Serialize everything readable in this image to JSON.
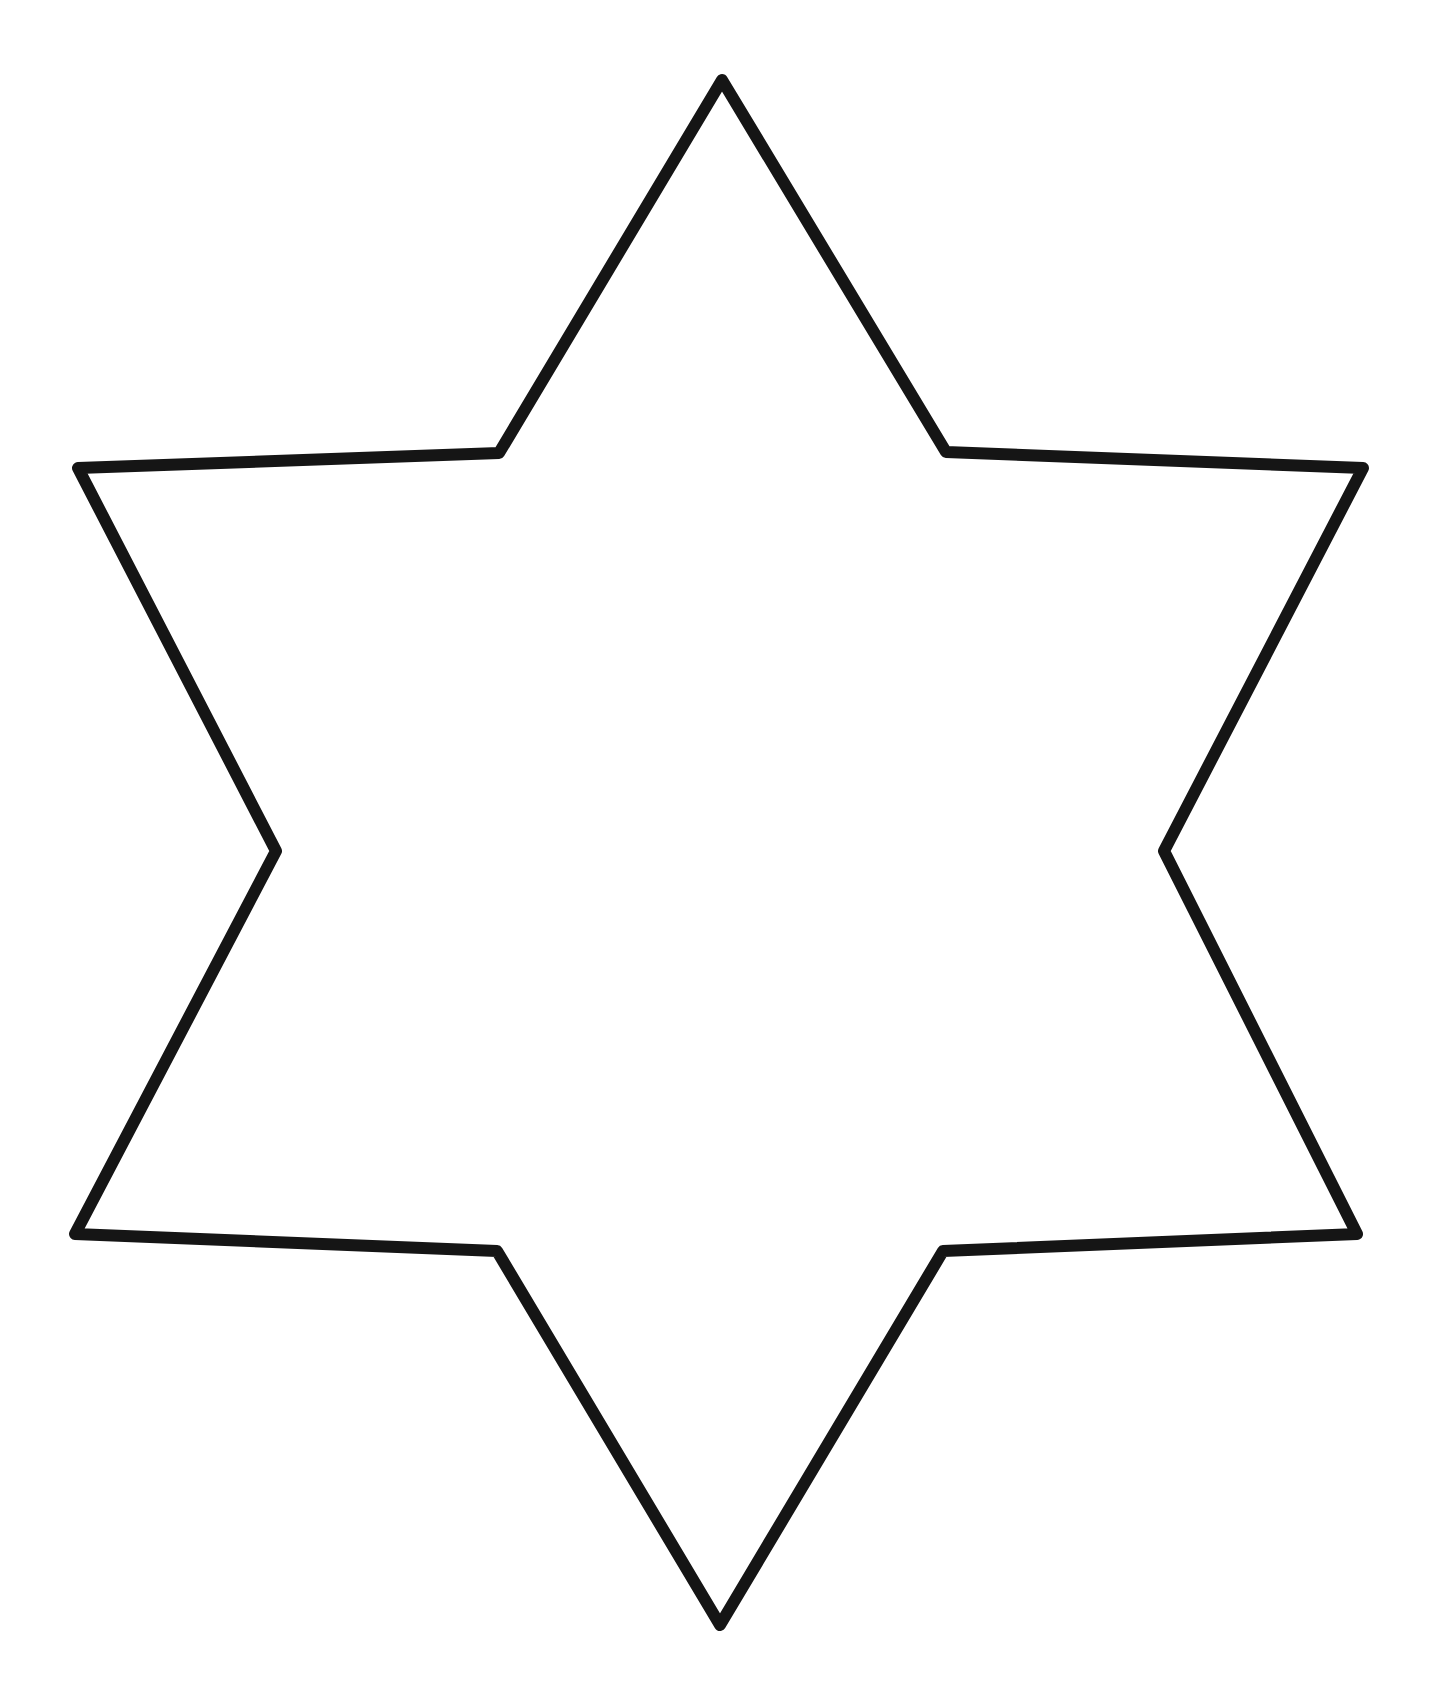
{
  "canvas": {
    "width": 1447,
    "height": 1698,
    "background": "#ffffff"
  },
  "shape": {
    "type": "six-pointed-star-outline",
    "stroke_color": "#151515",
    "fill_color": "#ffffff",
    "stroke_width": 12,
    "vertices": [
      [
        722,
        80
      ],
      [
        946,
        452
      ],
      [
        1363,
        468
      ],
      [
        1164,
        851
      ],
      [
        1357,
        1234
      ],
      [
        943,
        1251
      ],
      [
        720,
        1625
      ],
      [
        497,
        1251
      ],
      [
        75,
        1234
      ],
      [
        276,
        851
      ],
      [
        78,
        468
      ],
      [
        499,
        453
      ]
    ]
  }
}
